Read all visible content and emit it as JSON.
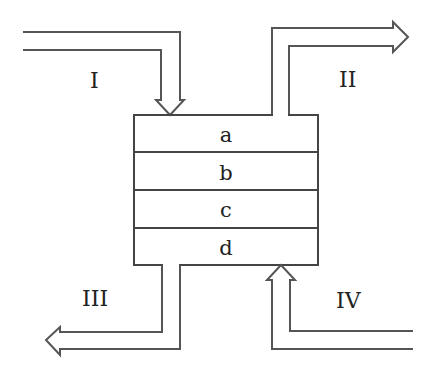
{
  "diagram": {
    "type": "flow-diagram",
    "box": {
      "layers": [
        {
          "id": "a",
          "label": "a"
        },
        {
          "id": "b",
          "label": "b"
        },
        {
          "id": "c",
          "label": "c"
        },
        {
          "id": "d",
          "label": "d"
        }
      ]
    },
    "streams": [
      {
        "id": "I",
        "label": "I",
        "direction": "in",
        "side": "top-left"
      },
      {
        "id": "II",
        "label": "II",
        "direction": "out",
        "side": "top-right"
      },
      {
        "id": "III",
        "label": "III",
        "direction": "out",
        "side": "bottom-left"
      },
      {
        "id": "IV",
        "label": "IV",
        "direction": "in",
        "side": "bottom-right"
      }
    ],
    "colors": {
      "line": "#555555",
      "text": "#222222",
      "background": "#ffffff"
    }
  }
}
